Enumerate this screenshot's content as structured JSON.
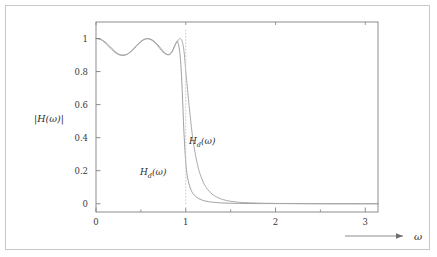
{
  "figure": {
    "background": "#ffffff",
    "border_color": "#c9c9c9",
    "axis_color": "#808080"
  },
  "axes": {
    "x_title": "ω",
    "y_title": "|H(ω)|",
    "x_ticks": [
      "0",
      "1",
      "2",
      "3"
    ],
    "x_tick_values": [
      0,
      1,
      2,
      3
    ],
    "x_minor_values": [
      0.5,
      1.5,
      2.5
    ],
    "y_ticks": [
      "0",
      "0.2",
      "0.4",
      "0.6",
      "0.8",
      "1"
    ],
    "y_tick_values": [
      0,
      0.2,
      0.4,
      0.6,
      0.8,
      1
    ]
  },
  "annotations": {
    "label_left": {
      "base": "H",
      "sub": "d",
      "arg": "(ω)"
    },
    "label_right": {
      "base": "H",
      "sub": "d",
      "arg": "(ω)"
    },
    "cutoff_line_label": "ω = 1"
  },
  "chart_data": {
    "type": "line",
    "title": "",
    "xlabel": "ω",
    "ylabel": "|H(ω)|",
    "xlim": [
      0,
      3.14159
    ],
    "ylim": [
      -0.05,
      1.1
    ],
    "grid": false,
    "legend": "inline-annotation",
    "cutoff": 1.0,
    "passband_ripple": {
      "min": 0.9,
      "max": 1.0
    },
    "series": [
      {
        "name": "H_d(ω) steep",
        "color": "#9a9a9a",
        "style": "solid",
        "x": [
          0.0,
          0.05,
          0.1,
          0.15,
          0.2,
          0.25,
          0.3,
          0.35,
          0.4,
          0.45,
          0.5,
          0.55,
          0.6,
          0.65,
          0.7,
          0.73,
          0.76,
          0.79,
          0.82,
          0.85,
          0.87,
          0.89,
          0.905,
          0.92,
          0.93,
          0.94,
          0.95,
          0.96,
          0.97,
          0.98,
          1.0,
          1.02,
          1.05,
          1.08,
          1.12,
          1.16,
          1.2,
          1.25,
          1.3,
          1.4,
          1.5,
          1.6,
          1.8,
          2.0,
          2.4,
          2.8,
          3.14
        ],
        "y": [
          1.0,
          0.995,
          0.975,
          0.948,
          0.921,
          0.903,
          0.898,
          0.906,
          0.928,
          0.957,
          0.983,
          0.998,
          0.996,
          0.978,
          0.948,
          0.928,
          0.912,
          0.903,
          0.906,
          0.925,
          0.948,
          0.972,
          0.985,
          0.962,
          0.93,
          0.88,
          0.8,
          0.69,
          0.56,
          0.43,
          0.25,
          0.16,
          0.095,
          0.062,
          0.04,
          0.027,
          0.019,
          0.013,
          0.009,
          0.005,
          0.003,
          0.002,
          0.001,
          0.001,
          0.0,
          0.0,
          0.0
        ]
      },
      {
        "name": "H_d(ω) shallow",
        "color": "#a5a5a5",
        "style": "solid",
        "x": [
          0.0,
          0.05,
          0.1,
          0.15,
          0.2,
          0.25,
          0.3,
          0.35,
          0.4,
          0.45,
          0.5,
          0.55,
          0.6,
          0.65,
          0.7,
          0.74,
          0.78,
          0.81,
          0.84,
          0.86,
          0.88,
          0.9,
          0.92,
          0.94,
          0.955,
          0.97,
          0.985,
          1.0,
          1.02,
          1.04,
          1.07,
          1.1,
          1.14,
          1.18,
          1.22,
          1.27,
          1.32,
          1.38,
          1.45,
          1.55,
          1.65,
          1.8,
          2.0,
          2.3,
          2.7,
          3.14
        ],
        "y": [
          1.0,
          0.996,
          0.98,
          0.955,
          0.928,
          0.907,
          0.899,
          0.905,
          0.925,
          0.953,
          0.98,
          0.997,
          0.998,
          0.983,
          0.955,
          0.929,
          0.908,
          0.901,
          0.912,
          0.932,
          0.957,
          0.978,
          0.993,
          1.0,
          0.99,
          0.96,
          0.9,
          0.8,
          0.69,
          0.58,
          0.43,
          0.32,
          0.215,
          0.15,
          0.105,
          0.07,
          0.048,
          0.032,
          0.02,
          0.011,
          0.007,
          0.004,
          0.002,
          0.001,
          0.0,
          0.0
        ]
      },
      {
        "name": "ideal cutoff marker",
        "color": "#cccccc",
        "style": "dotted",
        "x": [
          1.0,
          1.0
        ],
        "y": [
          0.0,
          1.05
        ]
      }
    ]
  }
}
